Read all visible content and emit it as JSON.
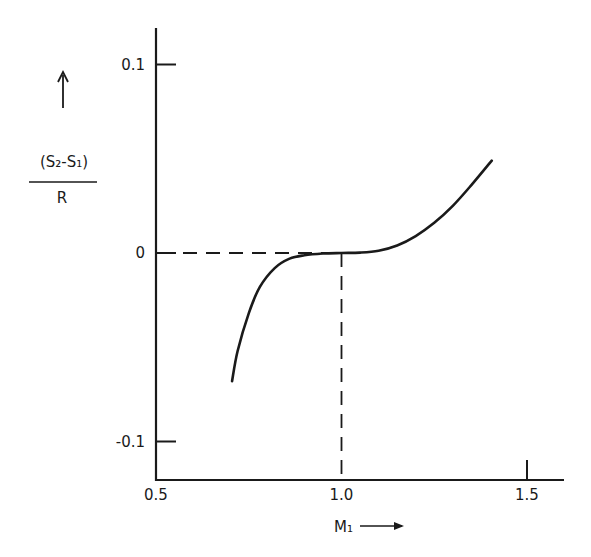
{
  "chart_data": {
    "type": "line",
    "title": "",
    "xlabel": "M₁ →",
    "ylabel": {
      "numerator": "(S₂-S₁)",
      "denominator": "R",
      "arrow": "↑"
    },
    "xlim": [
      0.5,
      1.6
    ],
    "ylim": [
      -0.125,
      0.12
    ],
    "x_ticks": [
      {
        "value": 0.5,
        "label": "0.5"
      },
      {
        "value": 1.0,
        "label": "1.0"
      },
      {
        "value": 1.5,
        "label": "1.5"
      }
    ],
    "y_ticks": [
      {
        "value": 0.1,
        "label": "0.1"
      },
      {
        "value": 0,
        "label": "0"
      },
      {
        "value": -0.1,
        "label": "-0.1"
      }
    ],
    "grid": false,
    "legend": null,
    "series": [
      {
        "name": "(S2-S1)/R vs M1",
        "style": "solid",
        "x": [
          0.705,
          0.72,
          0.75,
          0.78,
          0.82,
          0.86,
          0.9,
          0.95,
          1.0,
          1.05,
          1.1,
          1.15,
          1.2,
          1.25,
          1.3,
          1.35,
          1.405
        ],
        "y": [
          -0.068,
          -0.052,
          -0.032,
          -0.018,
          -0.008,
          -0.003,
          -0.0012,
          -0.0003,
          0.0,
          0.0002,
          0.0012,
          0.004,
          0.009,
          0.016,
          0.025,
          0.036,
          0.049
        ]
      }
    ],
    "annotations": [
      {
        "type": "dashed-hline",
        "y": 0,
        "x_from": 0.5,
        "x_to": 1.0
      },
      {
        "type": "dashed-vline",
        "x": 1.0,
        "y_from": 0,
        "y_to": -0.125
      }
    ]
  }
}
